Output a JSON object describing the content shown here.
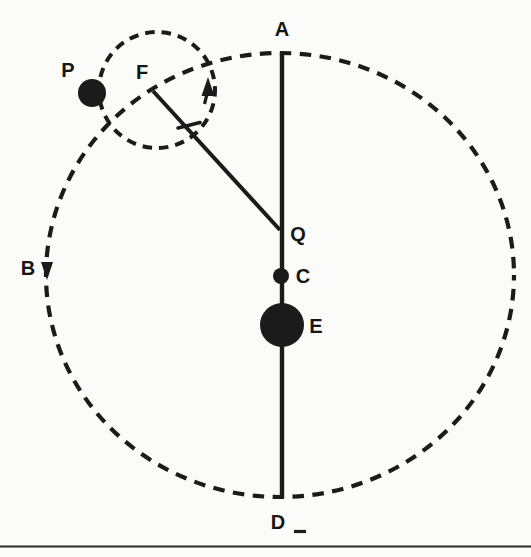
{
  "diagram": {
    "labels": {
      "A": "A",
      "B": "B",
      "C": "C",
      "D": "D",
      "E": "E",
      "F": "F",
      "P": "P",
      "Q": "Q"
    },
    "colors": {
      "ink": "#1b1b1b",
      "rule": "#2e2e2e",
      "paper": "#fbfbf9"
    },
    "arrows": {
      "large_orbit_direction": "counterclockwise",
      "small_circle_direction": "counterclockwise"
    }
  }
}
